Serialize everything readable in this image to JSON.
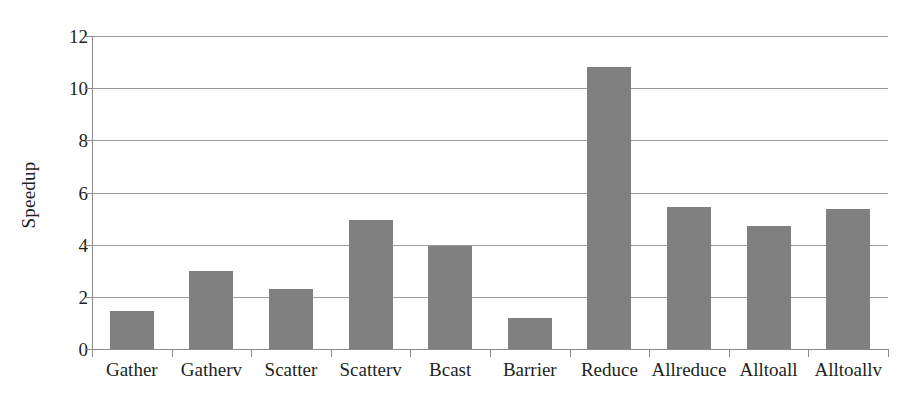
{
  "chart_data": {
    "type": "bar",
    "title": "",
    "xlabel": "",
    "ylabel": "Speedup",
    "ylim": [
      0,
      12
    ],
    "ytick_values": [
      0,
      2,
      4,
      6,
      8,
      10,
      12
    ],
    "ytick_labels": [
      "0",
      "2",
      "4",
      "6",
      "8",
      "10",
      "12"
    ],
    "grid": "horizontal",
    "legend": "none",
    "bar_color": "#808080",
    "categories": [
      "Gather",
      "Gatherv",
      "Scatter",
      "Scatterv",
      "Bcast",
      "Barrier",
      "Reduce",
      "Allreduce",
      "Alltoall",
      "Alltoallv"
    ],
    "values": [
      1.45,
      3.0,
      2.3,
      4.95,
      3.95,
      1.2,
      10.8,
      5.45,
      4.7,
      5.35
    ]
  }
}
